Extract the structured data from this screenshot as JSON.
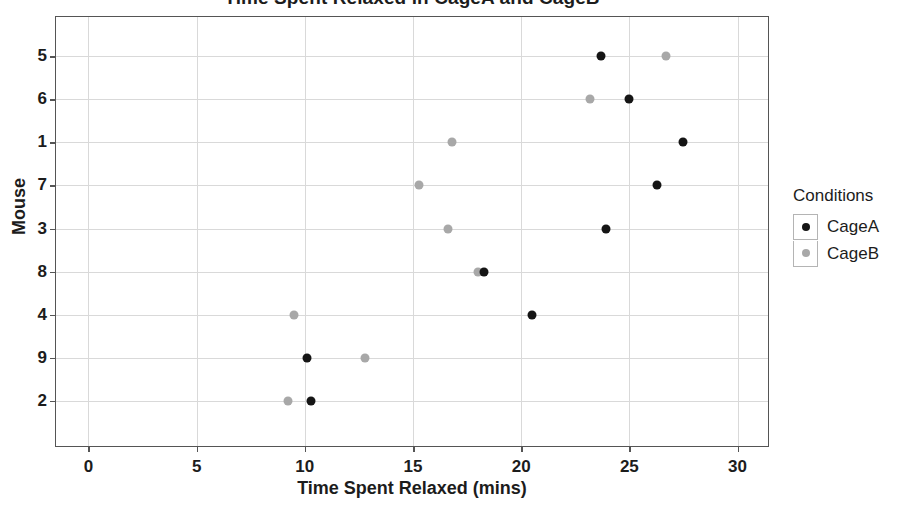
{
  "chart_data": {
    "type": "scatter",
    "title": "Time Spent Relaxed in CageA and CageB",
    "xlabel": "Time Spent Relaxed (mins)",
    "ylabel": "Mouse",
    "xlim": [
      -1.5,
      31.5
    ],
    "xticks": [
      0,
      5,
      10,
      15,
      20,
      25,
      30
    ],
    "xtick_labels": [
      "0",
      "5",
      "10",
      "15",
      "20",
      "25",
      "30"
    ],
    "categories": [
      "5",
      "6",
      "1",
      "7",
      "3",
      "8",
      "4",
      "9",
      "2"
    ],
    "grid": true,
    "legend_position": "right",
    "legend_title": "Conditions",
    "series": [
      {
        "name": "CageA",
        "color": "#151515",
        "points": [
          {
            "category": "5",
            "x": 23.7
          },
          {
            "category": "6",
            "x": 25.0
          },
          {
            "category": "1",
            "x": 27.5
          },
          {
            "category": "7",
            "x": 26.3
          },
          {
            "category": "3",
            "x": 23.9
          },
          {
            "category": "8",
            "x": 18.3
          },
          {
            "category": "4",
            "x": 20.5
          },
          {
            "category": "9",
            "x": 10.1
          },
          {
            "category": "2",
            "x": 10.3
          }
        ]
      },
      {
        "name": "CageB",
        "color": "#a8a8a8",
        "points": [
          {
            "category": "5",
            "x": 26.7
          },
          {
            "category": "6",
            "x": 23.2
          },
          {
            "category": "1",
            "x": 16.8
          },
          {
            "category": "7",
            "x": 15.3
          },
          {
            "category": "3",
            "x": 16.6
          },
          {
            "category": "8",
            "x": 18.0
          },
          {
            "category": "4",
            "x": 9.5
          },
          {
            "category": "9",
            "x": 12.8
          },
          {
            "category": "2",
            "x": 9.2
          }
        ]
      }
    ]
  },
  "legend": {
    "title": "Conditions",
    "items": [
      {
        "label": "CageA",
        "marker": "dot-black"
      },
      {
        "label": "CageB",
        "marker": "dot-gray"
      }
    ]
  }
}
